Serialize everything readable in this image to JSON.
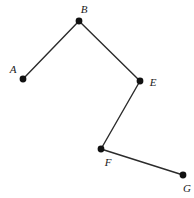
{
  "figure": {
    "background_color": "#ffffff",
    "stroke_color": "#2b2b2b",
    "vertex_color": "#111111",
    "label_color": "#1a1a1a",
    "stroke_width": 1.4,
    "vertex_radius": 3.4,
    "width": 194,
    "height": 198
  },
  "vertices": [
    {
      "id": "A",
      "label": "A",
      "x": 23,
      "y": 79,
      "label_x": 13,
      "label_y": 69
    },
    {
      "id": "B",
      "label": "B",
      "x": 79,
      "y": 21,
      "label_x": 84,
      "label_y": 9
    },
    {
      "id": "E",
      "label": "E",
      "x": 140,
      "y": 81,
      "label_x": 153,
      "label_y": 82
    },
    {
      "id": "F",
      "label": "F",
      "x": 101,
      "y": 149,
      "label_x": 108,
      "label_y": 162
    },
    {
      "id": "G",
      "label": "G",
      "x": 183,
      "y": 175,
      "label_x": 187,
      "label_y": 188
    }
  ],
  "edges": [
    {
      "id": "AB",
      "from": "A",
      "to": "B"
    },
    {
      "id": "BE",
      "from": "B",
      "to": "E"
    },
    {
      "id": "EF",
      "from": "E",
      "to": "F"
    },
    {
      "id": "FG",
      "from": "F",
      "to": "G"
    }
  ],
  "path_order": "A-B-E-F-G"
}
